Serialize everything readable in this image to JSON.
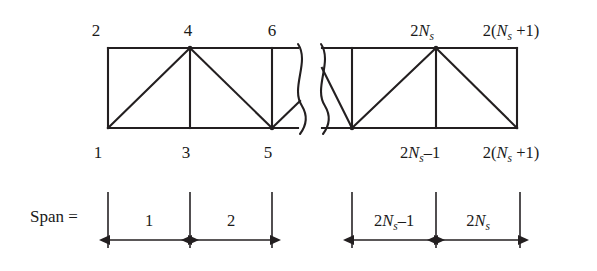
{
  "figure": {
    "span_label": "Span =",
    "colors": {
      "line": "#231f20",
      "text": "#1a1a1a",
      "background": "#ffffff"
    },
    "truss": {
      "left_segment": {
        "top_node_labels": [
          "2",
          "4",
          "6"
        ],
        "bottom_node_labels": [
          "1",
          "3",
          "5"
        ]
      },
      "right_segment": {
        "top_node_labels": [
          "2Ns",
          "2(Ns +1)"
        ],
        "bottom_node_labels": [
          "2Ns-1",
          "2(Ns +1)"
        ],
        "top_node_label_1_prefix": "2",
        "top_node_label_1_var": "N",
        "top_node_label_1_sub": "s",
        "top_node_label_2_prefix": "2(",
        "top_node_label_2_var": "N",
        "top_node_label_2_sub": "s",
        "top_node_label_2_suffix": " +1)",
        "bottom_node_label_1_prefix": "2",
        "bottom_node_label_1_var": "N",
        "bottom_node_label_1_sub": "s",
        "bottom_node_label_1_suffix": "–1",
        "bottom_node_label_2_prefix": "2(",
        "bottom_node_label_2_var": "N",
        "bottom_node_label_2_sub": "s",
        "bottom_node_label_2_suffix": " +1)"
      },
      "break_symbol": "double-wavy-break"
    },
    "spans": {
      "left": [
        {
          "label": "1"
        },
        {
          "label": "2"
        }
      ],
      "right": [
        {
          "label": "2Ns-1",
          "prefix": "2",
          "var": "N",
          "sub": "s",
          "suffix": "–1"
        },
        {
          "label": "2Ns",
          "prefix": "2",
          "var": "N",
          "sub": "s",
          "suffix": ""
        }
      ]
    }
  }
}
